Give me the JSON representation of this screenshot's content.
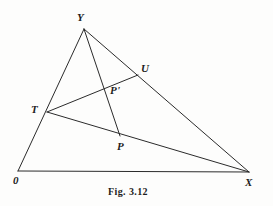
{
  "figure": {
    "caption": "Fig. 3.12",
    "caption_pos": {
      "x": 108,
      "y": 187
    },
    "background_color": "#fdfdfc",
    "stroke_color": "#2b2b2b",
    "label_color": "#1d1d1d",
    "stroke_width": 1,
    "width": 273,
    "height": 206
  },
  "points": [
    {
      "id": "O",
      "label": "0",
      "x": 18,
      "y": 171,
      "label_x": 13,
      "label_y": 175
    },
    {
      "id": "Y",
      "label": "Y",
      "x": 84,
      "y": 29,
      "label_x": 77,
      "label_y": 12
    },
    {
      "id": "X",
      "label": "X",
      "x": 249,
      "y": 172,
      "label_x": 245,
      "label_y": 177
    },
    {
      "id": "T",
      "label": "T",
      "x": 47,
      "y": 112,
      "label_x": 31,
      "label_y": 104
    },
    {
      "id": "U",
      "label": "U",
      "x": 138,
      "y": 75,
      "label_x": 141,
      "label_y": 63
    },
    {
      "id": "P",
      "label": "P",
      "x": 120,
      "y": 136,
      "label_x": 117,
      "label_y": 141
    },
    {
      "id": "Pp",
      "label": "P'",
      "x": 108,
      "y": 87,
      "label_x": 110,
      "label_y": 85
    }
  ],
  "segments": [
    {
      "id": "seg-O-Y",
      "from": "O",
      "to": "Y",
      "name": "segment-o-y"
    },
    {
      "id": "seg-O-X",
      "from": "O",
      "to": "X",
      "name": "segment-o-x"
    },
    {
      "id": "seg-Y-X",
      "from": "Y",
      "to": "X",
      "name": "segment-y-x"
    },
    {
      "id": "seg-T-U",
      "from": "T",
      "to": "U",
      "name": "segment-t-u"
    },
    {
      "id": "seg-T-X",
      "from": "T",
      "to": "X",
      "name": "segment-t-x"
    },
    {
      "id": "seg-Y-P",
      "from": "Y",
      "to": "P",
      "name": "segment-y-p"
    }
  ]
}
